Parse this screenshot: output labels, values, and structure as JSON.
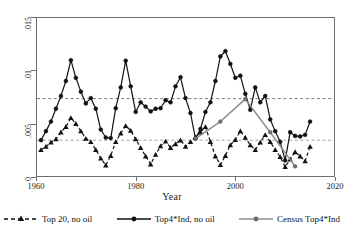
{
  "chart_data": {
    "type": "line",
    "title": "",
    "xlabel": "Year",
    "ylabel": "",
    "xlim": [
      1960,
      2020
    ],
    "ylim": [
      0,
      0.015
    ],
    "xticks": [
      1960,
      1980,
      2000,
      2020
    ],
    "xtick_labels": [
      "1960",
      "1980",
      "2000",
      "2020"
    ],
    "yticks": [
      0,
      0.005,
      0.01,
      0.015
    ],
    "ytick_labels": [
      "0",
      ".005",
      ".01",
      ".015"
    ],
    "grid": false,
    "legend_position": "below",
    "reference_lines": [
      {
        "name": "upper-mean-line",
        "y": 0.00735,
        "style": "dashed",
        "color": "#6f6f6f"
      },
      {
        "name": "lower-mean-line",
        "y": 0.00345,
        "style": "dashed",
        "color": "#9a9a9a"
      }
    ],
    "series": [
      {
        "name": "Top 20, no oil",
        "key": "top20-no-oil",
        "style": "dashed",
        "marker": "triangle",
        "color": "#111111",
        "x": [
          1961,
          1962,
          1963,
          1964,
          1965,
          1966,
          1967,
          1968,
          1969,
          1970,
          1971,
          1972,
          1973,
          1974,
          1975,
          1976,
          1977,
          1978,
          1979,
          1980,
          1981,
          1982,
          1983,
          1984,
          1985,
          1986,
          1987,
          1988,
          1989,
          1990,
          1991,
          1992,
          1993,
          1994,
          1995,
          1996,
          1997,
          1998,
          1999,
          2000,
          2001,
          2002,
          2003,
          2004,
          2005,
          2006,
          2007,
          2008,
          2009,
          2010,
          2011,
          2012,
          2013,
          2014,
          2015
        ],
        "y": [
          0.00255,
          0.00285,
          0.00325,
          0.00355,
          0.0042,
          0.0047,
          0.00555,
          0.005,
          0.0043,
          0.0036,
          0.0033,
          0.00255,
          0.00175,
          0.0011,
          0.002,
          0.0033,
          0.0041,
          0.0048,
          0.00435,
          0.00355,
          0.00275,
          0.00195,
          0.0012,
          0.0021,
          0.0029,
          0.00335,
          0.00275,
          0.0031,
          0.00345,
          0.00285,
          0.0033,
          0.00375,
          0.0042,
          0.0047,
          0.0033,
          0.00195,
          0.00115,
          0.002,
          0.003,
          0.0035,
          0.0043,
          0.0037,
          0.003,
          0.00255,
          0.00325,
          0.00395,
          0.0033,
          0.00255,
          0.0019,
          0.00095,
          0.00165,
          0.00235,
          0.00195,
          0.0015,
          0.00285
        ],
        "smoothed_overlay_y": [
          0.0033,
          0.0033,
          0.0033,
          0.0033,
          0.0033,
          0.0033,
          0.0033,
          0.0033,
          0.0033,
          0.0033,
          0.0033,
          0.0033,
          0.0033,
          0.0033,
          0.0033,
          0.0033,
          0.0033,
          0.0033,
          0.0033,
          0.0033,
          0.0033,
          0.0033,
          0.0033,
          0.0033,
          0.0033,
          0.0033,
          0.0033,
          0.0033,
          0.0033,
          0.0033,
          0.0033,
          0.0033,
          0.0033,
          0.0033,
          0.0033,
          0.0033,
          0.0033,
          0.0033,
          0.0033,
          0.0033,
          0.0033,
          0.0033,
          0.0033,
          0.0033,
          0.0033,
          0.0033,
          0.0033,
          0.0033,
          0.0033,
          0.0033,
          0.0033,
          0.0033,
          0.0033,
          0.0033,
          0.0033
        ]
      },
      {
        "name": "Top4*Ind, no oil",
        "key": "top4ind-no-oil",
        "style": "solid",
        "marker": "circle",
        "color": "#111111",
        "x": [
          1961,
          1962,
          1963,
          1964,
          1965,
          1966,
          1967,
          1968,
          1969,
          1970,
          1971,
          1972,
          1973,
          1974,
          1975,
          1976,
          1977,
          1978,
          1979,
          1980,
          1981,
          1982,
          1983,
          1984,
          1985,
          1986,
          1987,
          1988,
          1989,
          1990,
          1991,
          1992,
          1993,
          1994,
          1995,
          1996,
          1997,
          1998,
          1999,
          2000,
          2001,
          2002,
          2003,
          2004,
          2005,
          2006,
          2007,
          2008,
          2009,
          2010,
          2011,
          2012,
          2013,
          2014,
          2015
        ],
        "y": [
          0.00345,
          0.0043,
          0.0052,
          0.0064,
          0.0076,
          0.009,
          0.01095,
          0.0093,
          0.008,
          0.0069,
          0.0074,
          0.0064,
          0.00445,
          0.0037,
          0.00365,
          0.00645,
          0.0084,
          0.0109,
          0.0085,
          0.0061,
          0.007,
          0.0066,
          0.00615,
          0.0064,
          0.00645,
          0.0072,
          0.007,
          0.0085,
          0.00935,
          0.0074,
          0.006,
          0.0036,
          0.0045,
          0.0061,
          0.007,
          0.009,
          0.0113,
          0.0118,
          0.0106,
          0.0093,
          0.0095,
          0.0078,
          0.0063,
          0.0084,
          0.007,
          0.0076,
          0.0054,
          0.0043,
          0.0033,
          0.00155,
          0.0042,
          0.00385,
          0.0038,
          0.00395,
          0.0052
        ],
        "smoothed_overlay_y": []
      },
      {
        "name": "Census Top4*Ind",
        "key": "census-top4ind",
        "style": "solid",
        "marker": "circle",
        "color": "#8c8c8c",
        "x": [
          1992,
          1997,
          2002,
          2007,
          2012
        ],
        "y": [
          0.0036,
          0.0052,
          0.0073,
          0.0042,
          0.001
        ]
      }
    ]
  },
  "axis": {
    "x_title": "Year"
  },
  "legend": {
    "items": [
      {
        "label": "Top 20, no oil",
        "key": "top20-no-oil"
      },
      {
        "label": "Top4*Ind, no oil",
        "key": "top4ind-no-oil"
      },
      {
        "label": "Census Top4*Ind",
        "key": "census-top4ind"
      }
    ]
  }
}
